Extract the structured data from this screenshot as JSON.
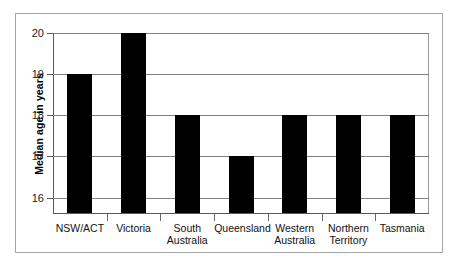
{
  "chart_data": {
    "type": "bar",
    "title": "",
    "xlabel": "",
    "ylabel": "Median age in years",
    "categories": [
      "NSW/ACT",
      "Victoria",
      "South\nAustralia",
      "Queensland",
      "Western\nAustralia",
      "Northern\nTerritory",
      "Tasmania"
    ],
    "values": [
      19,
      20,
      18,
      17,
      18,
      18,
      18
    ],
    "ylim": [
      15.6,
      20
    ],
    "yticks": [
      16,
      17,
      18,
      19,
      20
    ],
    "ytick_labels": [
      "16",
      "17",
      "18",
      "19",
      "20"
    ],
    "grid": true,
    "legend": false,
    "bar_color": "#000000",
    "gridline_color": "#808080",
    "axis_color": "#5a5a5a",
    "frame_color": "#a6a6a6",
    "background_color": "#ffffff"
  }
}
